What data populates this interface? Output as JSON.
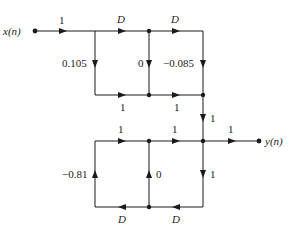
{
  "diagram": {
    "type": "signal-flow-graph",
    "input_label": "x(n)",
    "output_label": "y(n)",
    "colors": {
      "line": "#1a1a1a",
      "background": "#ffffff"
    },
    "top_section": {
      "input_gain": "1",
      "delay1": "D",
      "delay2": "D",
      "coef_b0": "0.105",
      "coef_b1": "0",
      "coef_b2": "-0.085",
      "sum_gain1": "1",
      "sum_gain2": "1"
    },
    "link_gain": "1",
    "bottom_section": {
      "fwd_gain1": "1",
      "fwd_gain2": "1",
      "output_gain": "1",
      "down_gain": "1",
      "coef_a1": "0",
      "coef_a2": "-0.81",
      "delay1": "D",
      "delay2": "D"
    }
  }
}
